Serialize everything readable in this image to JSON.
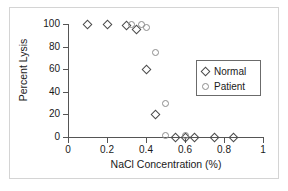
{
  "chart_data": {
    "type": "scatter",
    "title": "",
    "xlabel": "NaCl Concentration (%)",
    "ylabel": "Percent Lysis",
    "xlim": [
      0,
      1
    ],
    "ylim": [
      0,
      100
    ],
    "xticks": [
      "0",
      "0.2",
      "0.4",
      "0.6",
      "0.8",
      "1"
    ],
    "xtick_values": [
      0,
      0.2,
      0.4,
      0.6,
      0.8,
      1
    ],
    "yticks": [
      "0",
      "20",
      "40",
      "60",
      "80",
      "100"
    ],
    "ytick_values": [
      0,
      20,
      40,
      60,
      80,
      100
    ],
    "grid": false,
    "legend_position": "right-middle",
    "series": [
      {
        "name": "Normal",
        "marker": "diamond",
        "color": "#4a4a4a",
        "points": [
          {
            "x": 0.1,
            "y": 100
          },
          {
            "x": 0.2,
            "y": 100
          },
          {
            "x": 0.3,
            "y": 99
          },
          {
            "x": 0.35,
            "y": 95
          },
          {
            "x": 0.4,
            "y": 60
          },
          {
            "x": 0.45,
            "y": 20
          },
          {
            "x": 0.55,
            "y": 0
          },
          {
            "x": 0.6,
            "y": 0
          },
          {
            "x": 0.65,
            "y": 0
          },
          {
            "x": 0.75,
            "y": 0
          },
          {
            "x": 0.85,
            "y": 0
          }
        ]
      },
      {
        "name": "Patient",
        "marker": "circle",
        "color": "#8d8d8d",
        "points": [
          {
            "x": 0.325,
            "y": 100
          },
          {
            "x": 0.375,
            "y": 100
          },
          {
            "x": 0.4,
            "y": 97
          },
          {
            "x": 0.45,
            "y": 75
          },
          {
            "x": 0.5,
            "y": 30
          },
          {
            "x": 0.5,
            "y": 1
          },
          {
            "x": 0.6,
            "y": 1
          }
        ]
      }
    ]
  },
  "legend": {
    "entries": [
      {
        "label": "Normal"
      },
      {
        "label": "Patient"
      }
    ]
  }
}
